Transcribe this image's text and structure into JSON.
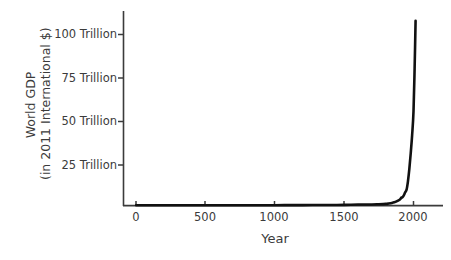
{
  "chart_data": {
    "type": "line",
    "title": "",
    "xlabel": "Year",
    "ylabel_lines": [
      "World GDP",
      "(in 2011 International $)"
    ],
    "ylabel": "World GDP (in 2011 International $)",
    "xlim": [
      -80,
      2100
    ],
    "ylim": [
      0,
      118
    ],
    "grid": false,
    "legend": false,
    "units": "Trillion 2011 International $",
    "xtick_values": [
      0,
      500,
      1000,
      1500,
      2000
    ],
    "xtick_labels": [
      "0",
      "500",
      "1000",
      "1500",
      "2000"
    ],
    "ytick_values": [
      25,
      50,
      75,
      100
    ],
    "ytick_labels": [
      "25 Trillion",
      "50 Trillion",
      "75 Trillion",
      "100 Trillion"
    ],
    "series": [
      {
        "name": "World GDP",
        "color": "#111111",
        "linewidth": 2.6,
        "x": [
          1,
          200,
          400,
          600,
          800,
          1000,
          1200,
          1300,
          1400,
          1500,
          1600,
          1700,
          1750,
          1800,
          1820,
          1850,
          1870,
          1900,
          1913,
          1920,
          1930,
          1940,
          1950,
          1960,
          1970,
          1980,
          1990,
          2000,
          2008,
          2015
        ],
        "y": [
          0.18,
          0.2,
          0.2,
          0.21,
          0.22,
          0.24,
          0.3,
          0.32,
          0.33,
          0.43,
          0.6,
          0.64,
          0.8,
          1.0,
          1.2,
          1.7,
          2.2,
          3.4,
          4.7,
          4.9,
          6.0,
          7.8,
          9.3,
          14.2,
          21.4,
          30.6,
          41.0,
          55.0,
          80.0,
          108.0
        ]
      }
    ]
  },
  "axes": {
    "ylabel_lines": [
      "World GDP",
      "(in 2011 International $)"
    ],
    "xlabel": "Year",
    "ytick_labels": [
      "100 Trillion",
      "75 Trillion",
      "50 Trillion",
      "25 Trillion"
    ],
    "xtick_labels": [
      "0",
      "500",
      "1000",
      "1500",
      "2000"
    ],
    "axis_color": "#3b3b3b",
    "line_color": "#111111",
    "background": "#ffffff"
  }
}
